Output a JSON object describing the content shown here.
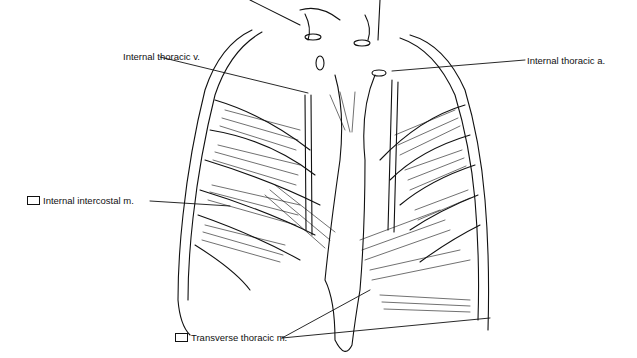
{
  "figure": {
    "type": "anatomical line drawing",
    "labels": [
      {
        "id": "internal-thoracic-v",
        "text": "Internal thoracic v.",
        "has_swatch": false,
        "anchor": [
          123,
          57
        ],
        "leader_to": [
          [
            308,
            93
          ]
        ]
      },
      {
        "id": "internal-thoracic-a",
        "text": "Internal thoracic a.",
        "has_swatch": false,
        "anchor": [
          527,
          60
        ],
        "leader_to": [
          [
            392,
            71
          ]
        ]
      },
      {
        "id": "internal-intercostal-m",
        "text": "Internal intercostal m.",
        "has_swatch": true,
        "anchor": [
          28,
          201
        ],
        "leader_to": [
          [
            230,
            206
          ]
        ]
      },
      {
        "id": "transverse-thoracic-m",
        "text": "Transverse thoracic m.",
        "has_swatch": true,
        "anchor": [
          176,
          338
        ],
        "leader_to": [
          [
            370,
            290
          ],
          [
            490,
            318
          ]
        ]
      }
    ]
  }
}
